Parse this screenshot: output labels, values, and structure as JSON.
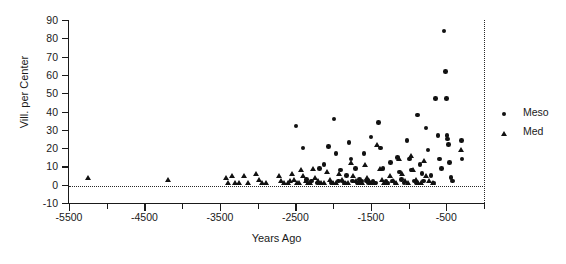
{
  "chart_data": {
    "type": "scatter",
    "title": "",
    "xlabel": "Years Ago",
    "ylabel": "Vill. per Center",
    "xlim": [
      -5500,
      0
    ],
    "ylim": [
      -10,
      90
    ],
    "yticks": [
      -10,
      0,
      10,
      20,
      30,
      40,
      50,
      60,
      70,
      80,
      90
    ],
    "ytick_labels": [
      "-10",
      "0",
      "10",
      "20",
      "30",
      "40",
      "50",
      "60",
      "70",
      "80",
      "90"
    ],
    "xticks_major": [
      -5500,
      -4500,
      -3500,
      -2500,
      -1500,
      -500
    ],
    "xtick_labels": [
      "-5500",
      "-4500",
      "-3500",
      "-2500",
      "-1500",
      "-500"
    ],
    "xticks_minor_step": 500,
    "grid": false,
    "reference_lines": [
      {
        "orientation": "horizontal",
        "value": 0,
        "style": "dotted"
      },
      {
        "orientation": "vertical",
        "value": 0,
        "style": "dotted"
      }
    ],
    "legend": {
      "position": "right",
      "entries": [
        {
          "name": "Meso",
          "marker": "circle"
        },
        {
          "name": "Med",
          "marker": "triangle"
        }
      ]
    },
    "series": [
      {
        "name": "Meso",
        "marker": "circle",
        "points": [
          [
            -2490,
            32
          ],
          [
            -2400,
            20
          ],
          [
            -2350,
            3
          ],
          [
            -2290,
            2
          ],
          [
            -2210,
            1
          ],
          [
            -2180,
            9
          ],
          [
            -2120,
            11
          ],
          [
            -2060,
            21
          ],
          [
            -2020,
            1
          ],
          [
            -1990,
            36
          ],
          [
            -1960,
            17
          ],
          [
            -1930,
            2
          ],
          [
            -1900,
            8
          ],
          [
            -1880,
            2
          ],
          [
            -1850,
            1
          ],
          [
            -1820,
            5
          ],
          [
            -1790,
            23
          ],
          [
            -1760,
            14
          ],
          [
            -1740,
            2
          ],
          [
            -1700,
            9
          ],
          [
            -1680,
            1
          ],
          [
            -1650,
            3
          ],
          [
            -1620,
            2
          ],
          [
            -1590,
            17
          ],
          [
            -1560,
            2
          ],
          [
            -1530,
            1
          ],
          [
            -1500,
            26
          ],
          [
            -1470,
            2
          ],
          [
            -1440,
            1
          ],
          [
            -1400,
            34
          ],
          [
            -1370,
            20
          ],
          [
            -1340,
            9
          ],
          [
            -1300,
            2
          ],
          [
            -1270,
            1
          ],
          [
            -1240,
            12
          ],
          [
            -1210,
            2
          ],
          [
            -1180,
            1
          ],
          [
            -1150,
            15
          ],
          [
            -1120,
            7
          ],
          [
            -1090,
            3
          ],
          [
            -1060,
            1
          ],
          [
            -1020,
            24
          ],
          [
            -990,
            14
          ],
          [
            -960,
            8
          ],
          [
            -930,
            2
          ],
          [
            -900,
            1
          ],
          [
            -880,
            38
          ],
          [
            -850,
            11
          ],
          [
            -820,
            6
          ],
          [
            -800,
            2
          ],
          [
            -770,
            31
          ],
          [
            -740,
            19
          ],
          [
            -700,
            5
          ],
          [
            -670,
            1
          ],
          [
            -640,
            47
          ],
          [
            -610,
            27
          ],
          [
            -590,
            14
          ],
          [
            -560,
            9
          ],
          [
            -530,
            84
          ],
          [
            -510,
            62
          ],
          [
            -500,
            47
          ],
          [
            -490,
            27
          ],
          [
            -480,
            25
          ],
          [
            -470,
            22
          ],
          [
            -460,
            12
          ],
          [
            -440,
            4
          ],
          [
            -420,
            2
          ],
          [
            -300,
            24
          ],
          [
            -290,
            14
          ]
        ]
      },
      {
        "name": "Med",
        "marker": "triangle",
        "points": [
          [
            -5240,
            4
          ],
          [
            -4180,
            3
          ],
          [
            -3420,
            4
          ],
          [
            -3390,
            1
          ],
          [
            -3340,
            5
          ],
          [
            -3300,
            1
          ],
          [
            -3250,
            1
          ],
          [
            -3180,
            5
          ],
          [
            -3120,
            1
          ],
          [
            -3020,
            6
          ],
          [
            -2980,
            3
          ],
          [
            -2940,
            1
          ],
          [
            -2890,
            1
          ],
          [
            -2720,
            5
          ],
          [
            -2690,
            2
          ],
          [
            -2650,
            1
          ],
          [
            -2600,
            1
          ],
          [
            -2570,
            2
          ],
          [
            -2540,
            6
          ],
          [
            -2510,
            3
          ],
          [
            -2480,
            1
          ],
          [
            -2450,
            1
          ],
          [
            -2420,
            8
          ],
          [
            -2390,
            5
          ],
          [
            -2360,
            2
          ],
          [
            -2330,
            1
          ],
          [
            -2300,
            1
          ],
          [
            -2270,
            9
          ],
          [
            -2240,
            4
          ],
          [
            -2200,
            2
          ],
          [
            -2160,
            1
          ],
          [
            -2120,
            1
          ],
          [
            -2080,
            7
          ],
          [
            -2040,
            3
          ],
          [
            -2000,
            1
          ],
          [
            -1960,
            1
          ],
          [
            -1920,
            6
          ],
          [
            -1880,
            3
          ],
          [
            -1840,
            1
          ],
          [
            -1800,
            1
          ],
          [
            -1760,
            12
          ],
          [
            -1730,
            5
          ],
          [
            -1700,
            2
          ],
          [
            -1660,
            1
          ],
          [
            -1620,
            1
          ],
          [
            -1580,
            11
          ],
          [
            -1550,
            4
          ],
          [
            -1520,
            2
          ],
          [
            -1490,
            1
          ],
          [
            -1450,
            1
          ],
          [
            -1410,
            22
          ],
          [
            -1380,
            9
          ],
          [
            -1350,
            3
          ],
          [
            -1320,
            1
          ],
          [
            -1280,
            1
          ],
          [
            -1240,
            5
          ],
          [
            -1200,
            2
          ],
          [
            -1160,
            1
          ],
          [
            -1120,
            14
          ],
          [
            -1090,
            6
          ],
          [
            -1050,
            2
          ],
          [
            -1010,
            1
          ],
          [
            -970,
            16
          ],
          [
            -940,
            8
          ],
          [
            -900,
            3
          ],
          [
            -870,
            1
          ],
          [
            -830,
            1
          ],
          [
            -790,
            13
          ],
          [
            -760,
            5
          ],
          [
            -720,
            2
          ],
          [
            -680,
            1
          ],
          [
            -300,
            19
          ]
        ]
      }
    ]
  },
  "axis": {
    "y_title": "Vill. per Center",
    "x_title": "Years Ago"
  }
}
